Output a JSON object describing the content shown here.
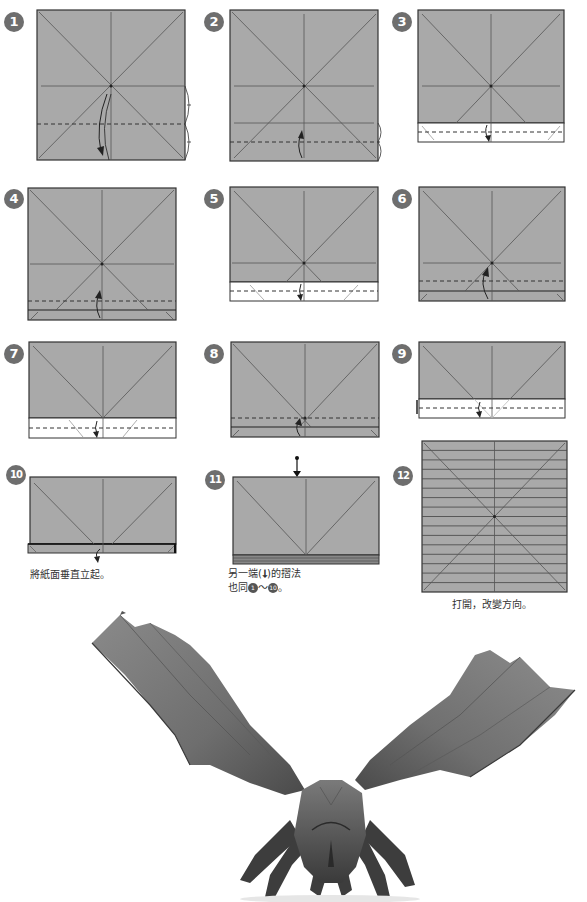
{
  "colors": {
    "paper_gray": "#a9a9a9",
    "paper_white": "#ffffff",
    "crease_line": "#555555",
    "badge": "#6e6e6e",
    "background": "#ffffff"
  },
  "steps": [
    {
      "number": "1",
      "action": "valley fold bottom edge to horizontal center crease (quarter-fold marks)",
      "icons": [
        "valley-fold-dashed-line",
        "fold-arrow",
        "equal-division-marks"
      ]
    },
    {
      "number": "2",
      "action": "valley fold up to lower quarter crease",
      "icons": [
        "valley-fold-dashed-line",
        "fold-arrow",
        "equal-division-marks"
      ]
    },
    {
      "number": "3",
      "action": "fold the white flap down",
      "icons": [
        "valley-fold-dashed-line",
        "fold-arrow"
      ]
    },
    {
      "number": "4",
      "action": "fold up",
      "icons": [
        "valley-fold-dashed-line",
        "fold-arrow"
      ]
    },
    {
      "number": "5",
      "action": "fold down",
      "icons": [
        "valley-fold-dashed-line",
        "fold-arrow"
      ]
    },
    {
      "number": "6",
      "action": "fold up",
      "icons": [
        "valley-fold-dashed-line",
        "fold-arrow"
      ]
    },
    {
      "number": "7",
      "action": "fold down",
      "icons": [
        "valley-fold-dashed-line",
        "fold-arrow"
      ]
    },
    {
      "number": "8",
      "action": "fold up",
      "icons": [
        "valley-fold-dashed-line",
        "fold-arrow"
      ]
    },
    {
      "number": "9",
      "action": "fold down",
      "icons": [
        "valley-fold-dashed-line",
        "fold-arrow"
      ]
    },
    {
      "number": "10",
      "caption": "將紙面垂直立起。",
      "icons": [
        "fold-arrow"
      ]
    },
    {
      "number": "11",
      "caption_line1_before": "另一端(",
      "caption_line1_after": ")的摺法",
      "caption_line2_before": "也同",
      "caption_ref_start": "1",
      "caption_tilde": "～",
      "caption_ref_end": "10",
      "caption_line2_after": "。",
      "icons": [
        "push-arrow"
      ]
    },
    {
      "number": "12",
      "caption": "打開，改變方向。",
      "icons": []
    }
  ],
  "photo": {
    "subject": "finished origami eagle with spread wings",
    "label": "origami-eagle-photo"
  }
}
